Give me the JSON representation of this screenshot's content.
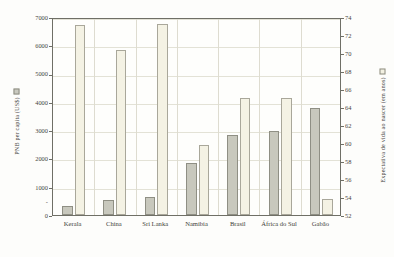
{
  "chart_data": {
    "type": "bar",
    "title": "",
    "subtitle": "",
    "xlabel": "",
    "categories": [
      "Kerala",
      "China",
      "Sri Lanka",
      "Namíbia",
      "Brasil",
      "África do Sul",
      "Gabão"
    ],
    "series": [
      {
        "name": "PNB per capita (US$)",
        "axis": "left",
        "color": "#c8c8bd",
        "values": [
          330,
          520,
          620,
          1830,
          2820,
          2960,
          3780
        ]
      },
      {
        "name": "Expectativa de vida ao nascer (em anos)",
        "axis": "right",
        "color": "#f4f2e4",
        "values": [
          73.1,
          70.3,
          73.2,
          59.8,
          65.0,
          65.0,
          53.8
        ]
      }
    ],
    "left_axis": {
      "label": "PNB per capita (US$)",
      "ylim": [
        0,
        7000
      ],
      "tick_step": 1000,
      "ticks": [
        0,
        1000,
        2000,
        3000,
        4000,
        5000,
        6000,
        7000
      ],
      "tick_labels": [
        "0",
        "1000",
        "2000",
        "3000",
        "4000",
        "5000",
        "6000",
        "7000"
      ]
    },
    "right_axis": {
      "label": "Expectativa de vida ao nascer (em anos)",
      "ylim": [
        52,
        74
      ],
      "tick_step": 2,
      "ticks": [
        52,
        54,
        56,
        58,
        60,
        62,
        64,
        66,
        68,
        70,
        72,
        74
      ],
      "tick_labels": [
        "52",
        "54",
        "56",
        "58",
        "60",
        "62",
        "64",
        "66",
        "68",
        "70",
        "72",
        "74"
      ]
    },
    "grid": true,
    "legend_position": "axis-titles",
    "legend": [
      {
        "label": "PNB per capita (US$)",
        "swatch": "#c8c8bd"
      },
      {
        "label": "Expectativa de vida ao nascer (em anos)",
        "swatch": "#f4f2e4"
      }
    ]
  },
  "axes": {
    "left_title": "PNB per capita (US$)",
    "right_title": "Expectativa de vida ao nascer (em anos)"
  }
}
